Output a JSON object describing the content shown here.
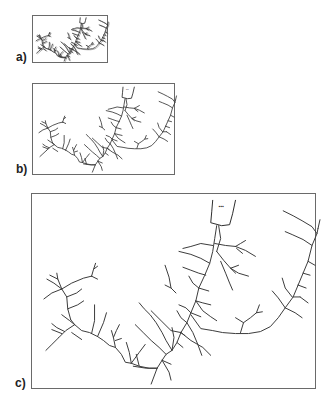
{
  "figure": {
    "panels": [
      {
        "id": "a",
        "label": "a)",
        "frame": {
          "x": 32,
          "y": 15,
          "w": 76,
          "h": 48
        },
        "label_pos": {
          "x": 16,
          "y": 51
        },
        "stroke": 0.9,
        "dense": true
      },
      {
        "id": "b",
        "label": "b)",
        "frame": {
          "x": 32,
          "y": 83,
          "w": 143,
          "h": 92
        },
        "label_pos": {
          "x": 16,
          "y": 163
        },
        "stroke": 0.9,
        "dense": false
      },
      {
        "id": "c",
        "label": "c)",
        "frame": {
          "x": 31,
          "y": 193,
          "w": 285,
          "h": 196
        },
        "label_pos": {
          "x": 15,
          "y": 377
        },
        "stroke": 1.0,
        "dense": false
      }
    ],
    "outlet_label": "▪▪▪",
    "line_color": "#3a3a3a",
    "frame_color": "#6a6a6a"
  },
  "network": {
    "viewbox": "0 0 285 196",
    "outlet": "M182 6 L181 18 L180 29 L191 32 L199 31 L202 20 L205 6",
    "outlet_label_pos": {
      "x": 188,
      "y": 14
    },
    "paths": [
      "M186 32 L184 45 L182 58 L179 70 L174 82 L168 95 L165 108 L160 120 L156 130 L150 140 L146 150 L141 158 L135 162 L131 168 L126 176 L120 192",
      "M188 32 L190 45 L186 58",
      "M182 52 L170 50 L160 53 L152 55",
      "M184 50 L195 52 L205 53",
      "M205 53 L210 50 L215 47",
      "M205 53 L215 57 L225 63",
      "M206 55 L212 60",
      "M186 58 L193 67 L200 75 L205 80",
      "M200 75 L208 72",
      "M200 75 L208 80 L218 83",
      "M190 68 L195 80 L199 90 L202 97",
      "M179 70 L170 65 L160 61 L148 58",
      "M175 82 L168 80 L160 77 L152 74",
      "M168 95 L162 90 L158 83",
      "M168 95 L178 98",
      "M165 108 L172 110 L180 112",
      "M165 108 L172 118 L180 124 L186 128",
      "M160 120 L170 124",
      "M160 120 L155 115 L148 112",
      "M156 130 L150 125 L146 118",
      "M156 130 L162 140 L167 152 L171 163",
      "M150 140 L160 148 L172 155 L180 163",
      "M150 140 L154 143",
      "M146 150 L152 155",
      "M141 158 L135 148 L131 140 L125 130 L119 122 L113 116 L108 110",
      "M135 162 L128 155 L120 148 L112 140 L104 132",
      "M131 168 L140 172",
      "M131 168 L138 180 L140 188",
      "M126 176 L115 176 L102 174",
      "M150 140 L140 138 L130 128 L120 118",
      "M141 158 L143 145 L141 135",
      "M160 122 L170 136 L182 138 L192 140 L205 141 L218 141 L230 139 L240 134 L248 125 L255 115 L263 104 L268 92",
      "M210 140 L213 130 L220 125 L226 120 L229 112",
      "M226 120 L232 119",
      "M213 130 L205 125",
      "M255 115 L248 105 L242 98",
      "M255 115 L265 120 L272 125",
      "M263 104 L270 104",
      "M268 92 L276 95",
      "M268 92 L273 80 L278 68 L282 52 L287 40 L288 35",
      "M282 52 L273 46 L262 41 L255 38",
      "M278 68 L285 72",
      "M273 80 L280 82",
      "M287 40 L282 33 L272 27 L263 22 L253 17",
      "M288 35 L290 26",
      "M262 104 L255 95 L252 85",
      "M270 104 L278 110",
      "M126 176 L118 176 L108 174 L100 171 L94 170 L90 162 L84 155 L78 153 L72 148 L66 144",
      "M100 171 L98 160 L95 150",
      "M100 171 L108 160 L114 152",
      "M108 174 L105 162",
      "M84 155 L82 145 L80 138",
      "M82 145 L85 138 L88 132",
      "M84 148 L90 146",
      "M66 144 L58 140 L50 138 L43 132 L39 127",
      "M66 144 L72 130 L75 120",
      "M60 141 L63 128 L63 112",
      "M43 132 L34 138 L27 145",
      "M43 132 L38 128 L30 122",
      "M40 140 L50 147",
      "M39 127 L36 116 L35 104 L30 96 L26 86 L25 80",
      "M35 104 L45 100 L50 96",
      "M36 116 L46 112 L52 108",
      "M30 96 L20 100 L12 106",
      "M30 96 L22 90 L15 86",
      "M26 86 L18 82",
      "M30 96 L40 90 L52 85 L60 83",
      "M60 83 L62 76 L64 70",
      "M62 76 L66 73",
      "M60 83 L66 86",
      "M27 145 L20 152 L14 158",
      "M33 139 L25 135 L20 131",
      "M30 141 L20 137",
      "M134 72 L138 84 L140 95 L145 100",
      "M140 95 L134 92"
    ]
  }
}
